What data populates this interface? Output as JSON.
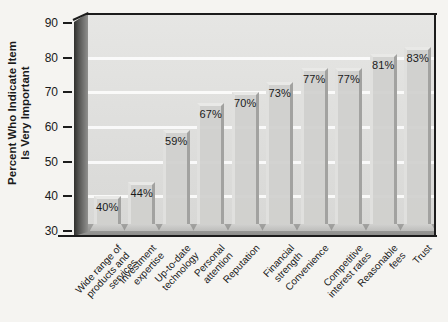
{
  "chart_data": {
    "type": "bar",
    "title": "",
    "ylabel_lines": [
      "Percent Who Indicate Item",
      "Is Very Important"
    ],
    "categories": [
      [
        "Wide range of",
        "products and",
        "services"
      ],
      [
        "Investment",
        "expertise"
      ],
      [
        "Up-to-date",
        "technology"
      ],
      [
        "Personal",
        "attention"
      ],
      [
        "Reputation"
      ],
      [
        "Financial",
        "strength"
      ],
      [
        "Convenience"
      ],
      [
        "Competitive",
        "interest rates"
      ],
      [
        "Reasonable",
        "fees"
      ],
      [
        "Trust"
      ]
    ],
    "values": [
      40,
      44,
      59,
      67,
      70,
      73,
      77,
      77,
      81,
      83
    ],
    "value_labels": [
      "40%",
      "44%",
      "59%",
      "67%",
      "70%",
      "73%",
      "77%",
      "77%",
      "81%",
      "83%"
    ],
    "y_ticks": [
      30,
      40,
      50,
      60,
      70,
      80,
      90
    ],
    "gridlines_at": [
      40,
      50,
      60,
      70,
      80
    ],
    "ylim": [
      30,
      90
    ],
    "grid": true,
    "legend": "none"
  },
  "colors": {
    "page_bg": "#f5f4f1",
    "wall": "#d8d8d6",
    "wall_top": "#e6e6e4",
    "gridline": "#ffffff",
    "bar_face": "#d0d0ce",
    "bar_light": "#e9e9e7",
    "bar_shadow": "#a2a2a0",
    "bar_base": "#bdbdbb",
    "left_wall_light": "#90908e",
    "floor": "#8d8d8b",
    "frame": "#1c1c1c",
    "text": "#1a1a1a"
  }
}
